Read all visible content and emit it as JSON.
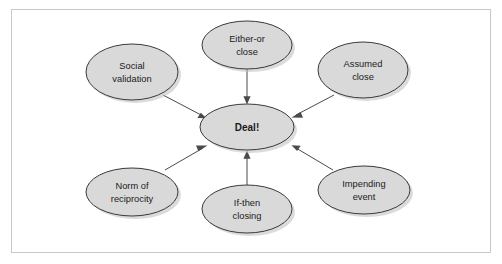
{
  "diagram": {
    "type": "radial-hub-and-spoke",
    "frame": {
      "border_color": "#c9c9c9",
      "background_color": "#ffffff"
    },
    "style": {
      "node_fill": "#d9d9d9",
      "node_stroke": "#3a3a3a",
      "edge_color": "#4a4a4a",
      "text_color": "#1b1b1b"
    },
    "center_node": {
      "id": "deal",
      "label": "Deal!",
      "label_line1": "Deal!",
      "bold": true,
      "cx": 247,
      "cy": 127,
      "rx": 47,
      "ry": 23
    },
    "nodes": [
      {
        "id": "social-validation",
        "label": "Social validation",
        "label_line1": "Social",
        "label_line2": "validation",
        "position": "top-left",
        "cx": 132,
        "cy": 72,
        "rx": 46,
        "ry": 28
      },
      {
        "id": "either-or-close",
        "label": "Either-or close",
        "label_line1": "Either-or",
        "label_line2": "close",
        "position": "top-center",
        "cx": 247,
        "cy": 45,
        "rx": 45,
        "ry": 24
      },
      {
        "id": "assumed-close",
        "label": "Assumed close",
        "label_line1": "Assumed",
        "label_line2": "close",
        "position": "top-right",
        "cx": 363,
        "cy": 70,
        "rx": 45,
        "ry": 28
      },
      {
        "id": "norm-of-reciprocity",
        "label": "Norm of reciprocity",
        "label_line1": "Norm of",
        "label_line2": "reciprocity",
        "position": "bottom-left",
        "cx": 132,
        "cy": 192,
        "rx": 46,
        "ry": 24
      },
      {
        "id": "if-then-closing",
        "label": "If-then closing",
        "label_line1": "If-then",
        "label_line2": "closing",
        "position": "bottom-center",
        "cx": 247,
        "cy": 209,
        "rx": 45,
        "ry": 24
      },
      {
        "id": "impending-event",
        "label": "Impending event",
        "label_line1": "Impending",
        "label_line2": "event",
        "position": "bottom-right",
        "cx": 364,
        "cy": 190,
        "rx": 46,
        "ry": 24
      }
    ],
    "edges": [
      {
        "id": "edge-social-validation-deal",
        "from": "social-validation",
        "to": "deal",
        "direction": "to-center",
        "arrowhead": true
      },
      {
        "id": "edge-either-or-close-deal",
        "from": "either-or-close",
        "to": "deal",
        "direction": "to-center",
        "arrowhead": true
      },
      {
        "id": "edge-assumed-close-deal",
        "from": "assumed-close",
        "to": "deal",
        "direction": "to-center",
        "arrowhead": true
      },
      {
        "id": "edge-norm-of-reciprocity-deal",
        "from": "norm-of-reciprocity",
        "to": "deal",
        "direction": "to-center",
        "arrowhead": true
      },
      {
        "id": "edge-if-then-closing-deal",
        "from": "if-then-closing",
        "to": "deal",
        "direction": "to-center",
        "arrowhead": true
      },
      {
        "id": "edge-impending-event-deal",
        "from": "impending-event",
        "to": "deal",
        "direction": "to-center",
        "arrowhead": true
      }
    ]
  }
}
